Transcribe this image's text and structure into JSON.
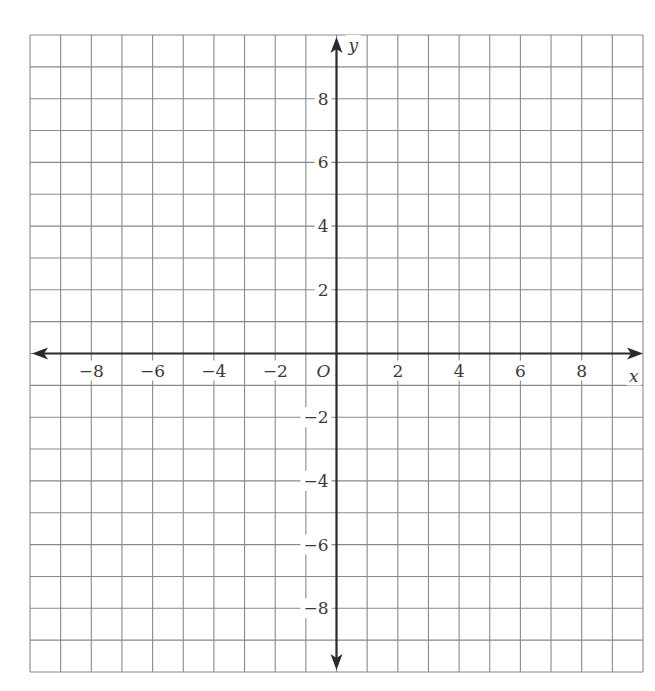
{
  "chart_data": {
    "type": "scatter",
    "title": "",
    "subtitle": "",
    "xlabel": "x",
    "ylabel": "y",
    "origin_label": "O",
    "xlim": [
      -10,
      10
    ],
    "ylim": [
      -10,
      10
    ],
    "grid": true,
    "grid_step": 1,
    "x_ticks": [
      -8,
      -6,
      -4,
      -2,
      2,
      4,
      6,
      8
    ],
    "y_ticks": [
      -8,
      -6,
      -4,
      -2,
      2,
      4,
      6,
      8
    ],
    "x_tick_labels": [
      "−8",
      "−6",
      "−4",
      "−2",
      "2",
      "4",
      "6",
      "8"
    ],
    "y_tick_labels": [
      "−8",
      "−6",
      "−4",
      "−2",
      "2",
      "4",
      "6",
      "8"
    ],
    "series": [],
    "legend": null
  },
  "colors": {
    "grid": "#8a8a8a",
    "axis": "#2a2a2a",
    "label": "#3a3a3a",
    "background": "#ffffff"
  },
  "layout": {
    "left": 30,
    "top": 35,
    "right": 643,
    "bottom": 672,
    "origin_x": 334,
    "origin_y": 354
  }
}
